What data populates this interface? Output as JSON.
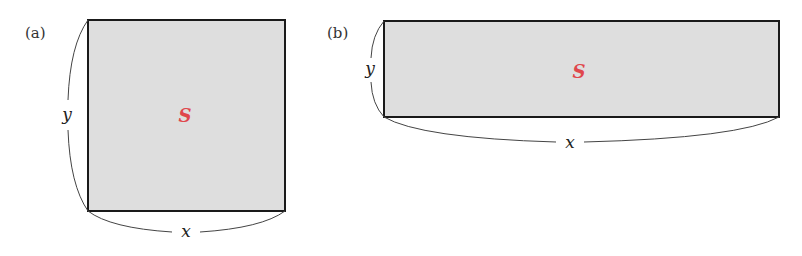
{
  "figure": {
    "panels": [
      {
        "id": "a",
        "label": "(a)",
        "shape": "square",
        "width_label": "x",
        "height_label": "y",
        "area_label": "S"
      },
      {
        "id": "b",
        "label": "(b)",
        "shape": "wide-rectangle",
        "width_label": "x",
        "height_label": "y",
        "area_label": "S"
      }
    ],
    "colors": {
      "fill": "#dedede",
      "outline": "#1a1a1a",
      "area_label": "#e0474c",
      "brace": "#444444"
    }
  }
}
